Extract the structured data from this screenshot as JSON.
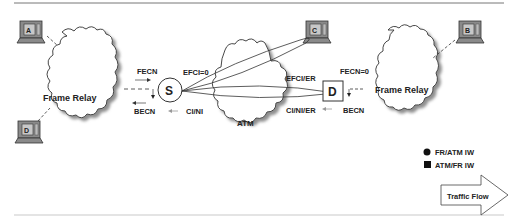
{
  "diagram": {
    "clouds": [
      {
        "id": "fr-left",
        "label": "Frame Relay"
      },
      {
        "id": "atm",
        "label": "ATM"
      },
      {
        "id": "fr-right",
        "label": "Frame Relay"
      }
    ],
    "terminals": [
      {
        "id": "A",
        "label": "A"
      },
      {
        "id": "B",
        "label": "B"
      },
      {
        "id": "C",
        "label": "C"
      },
      {
        "id": "D",
        "label": "D"
      }
    ],
    "nodes": {
      "source": {
        "label": "S",
        "shape": "circle"
      },
      "destination": {
        "label": "D",
        "shape": "square"
      }
    },
    "signals": {
      "left_fecn": "FECN",
      "left_becn": "BECN",
      "efci_zero": "EFCI=0",
      "ci_ni": "CI/NI",
      "efci_er": "EFCI/ER",
      "ci_ni_er": "CI/NI/ER",
      "right_fecn": "FECN=0",
      "right_becn": "BECN"
    },
    "legend": {
      "items": [
        {
          "symbol": "circle",
          "label": "FR/ATM IW"
        },
        {
          "symbol": "square",
          "label": "ATM/FR IW"
        }
      ],
      "arrow_label": "Traffic Flow"
    },
    "colors": {
      "line": "#333333",
      "shadow": "#9a9a9a",
      "terminal_body": "#8a8a8a",
      "terminal_screen": "#c8c8c8"
    }
  }
}
